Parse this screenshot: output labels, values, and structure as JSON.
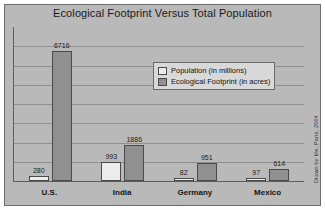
{
  "chart_data": {
    "type": "bar",
    "title": "Ecological Footprint Versus Total Population",
    "xlabel": "",
    "ylabel": "",
    "ylim": [
      0,
      7000
    ],
    "grid": true,
    "gridline_count": 7,
    "legend_position": "inside-top-right",
    "categories": [
      "U.S.",
      "India",
      "Germany",
      "Mexico"
    ],
    "series": [
      {
        "name": "Population (in millions)",
        "color": "#ececec",
        "values": [
          280,
          993,
          82,
          97
        ]
      },
      {
        "name": "Ecological Footprint (in acres)",
        "color": "#909090",
        "values": [
          6716,
          1886,
          951,
          614
        ]
      }
    ],
    "annotations": {
      "credit": "Drawn by Me, Paris, 2004"
    }
  },
  "legend": {
    "items": [
      {
        "label": "Population (in millions)"
      },
      {
        "label": "Ecological Footprint (in acres)"
      }
    ]
  },
  "colors": {
    "panel_background": "#b9b9b9",
    "population_bar": "#ececec",
    "footprint_bar": "#909090",
    "axis_line": "#5d5d5d",
    "gridline": "#8f8f8f"
  }
}
